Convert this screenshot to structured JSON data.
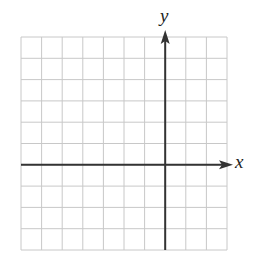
{
  "diagram": {
    "type": "coordinate-plane",
    "grid": {
      "columns": 10,
      "rows": 10,
      "left": 21,
      "top": 37,
      "right": 227,
      "bottom": 250,
      "line_color": "#c8c8c8",
      "line_width": 1
    },
    "axes": {
      "color": "#333333",
      "line_width": 2,
      "x_axis": {
        "label": "x",
        "grid_row_index": 6,
        "arrow_direction": "right",
        "arrow_tip_x": 233
      },
      "y_axis": {
        "label": "y",
        "grid_col_index": 7,
        "arrow_direction": "up",
        "arrow_tip_y": 30
      }
    }
  }
}
